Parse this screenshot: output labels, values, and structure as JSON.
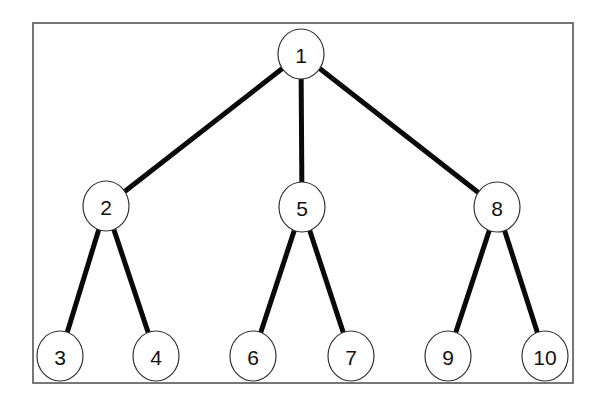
{
  "diagram": {
    "type": "tree",
    "frame": {
      "x": 33,
      "y": 23,
      "width": 540,
      "height": 360
    },
    "node_radius_x": 23,
    "node_radius_y": 25,
    "nodes": [
      {
        "id": "1",
        "label": "1",
        "x": 301,
        "y": 54
      },
      {
        "id": "2",
        "label": "2",
        "x": 106,
        "y": 206
      },
      {
        "id": "5",
        "label": "5",
        "x": 302,
        "y": 207
      },
      {
        "id": "8",
        "label": "8",
        "x": 497,
        "y": 207
      },
      {
        "id": "3",
        "label": "3",
        "x": 60,
        "y": 356
      },
      {
        "id": "4",
        "label": "4",
        "x": 156,
        "y": 356
      },
      {
        "id": "6",
        "label": "6",
        "x": 253,
        "y": 356
      },
      {
        "id": "7",
        "label": "7",
        "x": 351,
        "y": 356
      },
      {
        "id": "9",
        "label": "9",
        "x": 448,
        "y": 356
      },
      {
        "id": "10",
        "label": "10",
        "x": 545,
        "y": 356
      }
    ],
    "edges": [
      {
        "from": "1",
        "to": "2"
      },
      {
        "from": "1",
        "to": "5"
      },
      {
        "from": "1",
        "to": "8"
      },
      {
        "from": "2",
        "to": "3"
      },
      {
        "from": "2",
        "to": "4"
      },
      {
        "from": "5",
        "to": "6"
      },
      {
        "from": "5",
        "to": "7"
      },
      {
        "from": "8",
        "to": "9"
      },
      {
        "from": "8",
        "to": "10"
      }
    ]
  }
}
